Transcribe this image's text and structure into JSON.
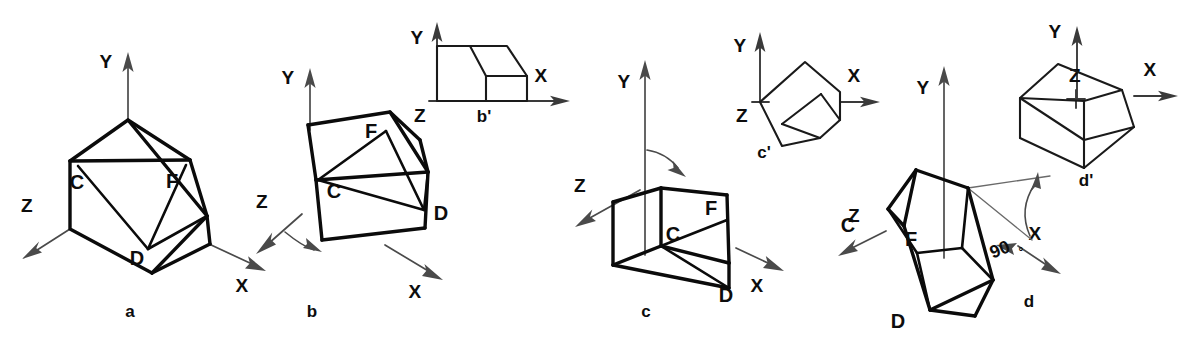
{
  "figure": {
    "background_color": "#ffffff",
    "line_color": "#0b0b0b",
    "axis_color": "#4a4a4a",
    "panel_labels": {
      "a": "a",
      "b": "b",
      "b_prime": "b'",
      "c": "c",
      "c_prime": "c'",
      "d": "d",
      "d_prime": "d'"
    },
    "axis_labels": {
      "x": "X",
      "y": "Y",
      "z": "Z"
    },
    "vertex_labels": {
      "c": "C",
      "d": "D",
      "f": "F"
    },
    "angle_annotation": {
      "value": "90",
      "degree_symbol": "°"
    },
    "panels": [
      {
        "id": "a",
        "label": "a",
        "kind": "pictorial",
        "axes": [
          "Y",
          "Z",
          "X"
        ],
        "vertices_shown": [
          "C",
          "F",
          "D"
        ]
      },
      {
        "id": "b",
        "label": "b",
        "kind": "pictorial",
        "axes": [
          "Y",
          "Z",
          "X"
        ],
        "vertices_shown": [
          "C",
          "F",
          "D"
        ]
      },
      {
        "id": "b-prime",
        "label": "b'",
        "kind": "orthographic",
        "axes": [
          "Y",
          "Z",
          "X"
        ],
        "vertices_shown": []
      },
      {
        "id": "c",
        "label": "c",
        "kind": "pictorial",
        "axes": [
          "Y",
          "Z",
          "X"
        ],
        "vertices_shown": [
          "C",
          "F",
          "D"
        ]
      },
      {
        "id": "c-prime",
        "label": "c'",
        "kind": "orthographic",
        "axes": [
          "Y",
          "Z",
          "X"
        ],
        "vertices_shown": []
      },
      {
        "id": "d",
        "label": "d",
        "kind": "pictorial",
        "axes": [
          "Y",
          "X"
        ],
        "vertices_shown": [
          "C",
          "F",
          "D"
        ],
        "annotation": "90°"
      },
      {
        "id": "d-prime",
        "label": "d'",
        "kind": "pictorial",
        "axes": [
          "Y",
          "X",
          "Z"
        ],
        "vertices_shown": []
      }
    ]
  }
}
